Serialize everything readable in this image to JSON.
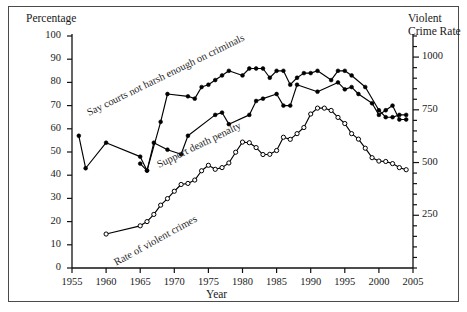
{
  "figure": {
    "background": "#ffffff",
    "border_color": "#4a4a4a",
    "left_axis_title": "Percentage",
    "right_axis_title_line1": "Violent",
    "right_axis_title_line2": "Crime Rate",
    "x_axis_title": "Year"
  },
  "chart_data": {
    "type": "line",
    "title": "",
    "xlabel": "Year",
    "ylabel": "Percentage",
    "y2label": "Violent Crime Rate",
    "xlim": [
      1955,
      2005
    ],
    "ylim": [
      0,
      100
    ],
    "y2lim": [
      0,
      1100
    ],
    "grid": false,
    "legend": "inline-annotations",
    "x_ticks": [
      "1955",
      "1960",
      "1965",
      "1970",
      "1975",
      "1980",
      "1985",
      "1990",
      "1995",
      "2000",
      "2005"
    ],
    "y_ticks_left": [
      "0",
      "10",
      "20",
      "30",
      "40",
      "50",
      "60",
      "70",
      "80",
      "90",
      "100"
    ],
    "y_ticks_right": [
      "250",
      "500",
      "750",
      "1000"
    ],
    "y_minor_step_right": 50,
    "annotations": [
      {
        "text": "Say courts not harsh enough on criminals",
        "series": "courts_not_harsh_enough"
      },
      {
        "text": "Support death penalty",
        "series": "support_death_penalty"
      },
      {
        "text": "Rate of violent crimes",
        "series": "rate_of_violent_crimes"
      }
    ],
    "series": [
      {
        "name": "Say courts not harsh enough on criminals",
        "axis": "left",
        "marker": "filled-circle",
        "color": "#000000",
        "x": [
          1956,
          1957,
          1960,
          1965,
          1966,
          1968,
          1969,
          1972,
          1973,
          1974,
          1975,
          1976,
          1977,
          1978,
          1980,
          1981,
          1982,
          1983,
          1984,
          1985,
          1986,
          1987,
          1988,
          1989,
          1990,
          1991,
          1993,
          1994,
          1995,
          1996,
          1998,
          2000,
          2001,
          2002,
          2003,
          2004
        ],
        "values": [
          57,
          43,
          54,
          48,
          42,
          63,
          75,
          74,
          73,
          78,
          79,
          81,
          83,
          85,
          83,
          86,
          86,
          86,
          82,
          85,
          85,
          79,
          82,
          84,
          84,
          85,
          81,
          85,
          85,
          83,
          78,
          68,
          65,
          65,
          66,
          66
        ]
      },
      {
        "name": "Support death penalty",
        "axis": "left",
        "marker": "filled-circle",
        "color": "#000000",
        "x": [
          1965,
          1966,
          1967,
          1969,
          1971,
          1972,
          1976,
          1977,
          1978,
          1981,
          1982,
          1983,
          1985,
          1986,
          1987,
          1988,
          1991,
          1994,
          1995,
          1996,
          1997,
          1999,
          2000,
          2001,
          2002,
          2003,
          2004
        ],
        "values": [
          45,
          42,
          54,
          51,
          49,
          57,
          66,
          67,
          62,
          66,
          72,
          73,
          75,
          70,
          70,
          79,
          76,
          80,
          77,
          78,
          75,
          71,
          66,
          68,
          70,
          64,
          64
        ]
      },
      {
        "name": "Rate of violent crimes",
        "axis": "right",
        "marker": "open-circle",
        "color": "#000000",
        "x": [
          1960,
          1965,
          1966,
          1967,
          1968,
          1969,
          1970,
          1971,
          1972,
          1973,
          1974,
          1975,
          1976,
          1977,
          1978,
          1979,
          1980,
          1981,
          1982,
          1983,
          1984,
          1985,
          1986,
          1987,
          1988,
          1989,
          1990,
          1991,
          1992,
          1993,
          1994,
          1995,
          1996,
          1997,
          1998,
          1999,
          2000,
          2001,
          2002,
          2003,
          2004
        ],
        "values": [
          161,
          200,
          220,
          254,
          298,
          329,
          364,
          396,
          401,
          417,
          461,
          487,
          468,
          476,
          498,
          549,
          597,
          594,
          571,
          538,
          539,
          557,
          620,
          610,
          637,
          666,
          730,
          758,
          758,
          747,
          714,
          685,
          637,
          611,
          568,
          523,
          507,
          505,
          495,
          476,
          466
        ]
      }
    ]
  }
}
